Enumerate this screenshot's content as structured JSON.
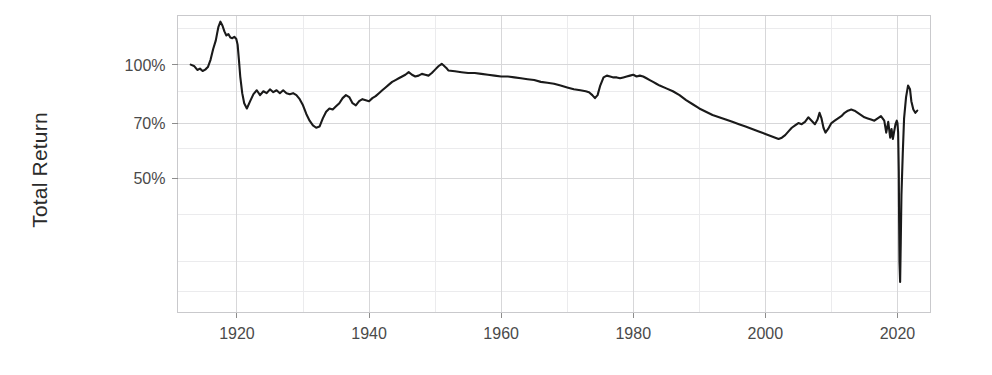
{
  "chart_data": {
    "type": "line",
    "title": "",
    "subtitle": "",
    "xlabel": "",
    "ylabel": "Total Return",
    "y_scale": "log",
    "x_scale": "linear",
    "grid": true,
    "legend": "none",
    "xlim": [
      1911,
      2025
    ],
    "ylim": [
      22,
      135
    ],
    "x_ticks": [
      1920,
      1940,
      1960,
      1980,
      2000,
      2020
    ],
    "x_tick_labels": [
      "1920",
      "1940",
      "1960",
      "1980",
      "2000",
      "2020"
    ],
    "y_ticks": [
      100,
      70,
      50
    ],
    "y_tick_labels": [
      "100%",
      "70%",
      "50%"
    ],
    "line_color": "#1a1a1a",
    "series": [
      {
        "name": "Total Return",
        "x": [
          1913.0,
          1913.5,
          1914.0,
          1914.4,
          1914.8,
          1915.2,
          1915.6,
          1916.0,
          1916.4,
          1916.8,
          1917.0,
          1917.2,
          1917.5,
          1917.8,
          1918.1,
          1918.4,
          1918.7,
          1919.0,
          1919.3,
          1919.6,
          1919.9,
          1920.1,
          1920.3,
          1920.5,
          1920.8,
          1921.1,
          1921.5,
          1922.0,
          1922.5,
          1923.0,
          1923.5,
          1924.0,
          1924.5,
          1925.0,
          1925.5,
          1926.0,
          1926.5,
          1927.0,
          1927.5,
          1928.0,
          1928.5,
          1929.0,
          1929.5,
          1930.0,
          1930.5,
          1931.0,
          1931.5,
          1932.0,
          1932.5,
          1933.0,
          1933.5,
          1934.0,
          1934.5,
          1935.0,
          1935.5,
          1936.0,
          1936.5,
          1937.0,
          1937.5,
          1938.0,
          1938.5,
          1939.0,
          1939.5,
          1940.0,
          1940.5,
          1941.0,
          1941.5,
          1942.0,
          1942.5,
          1943.0,
          1943.5,
          1944.0,
          1944.5,
          1945.0,
          1945.5,
          1946.0,
          1946.5,
          1947.0,
          1947.5,
          1948.0,
          1948.5,
          1949.0,
          1949.5,
          1950.0,
          1950.5,
          1951.0,
          1951.3,
          1951.7,
          1952.0,
          1953.0,
          1954.0,
          1955.0,
          1956.0,
          1957.0,
          1958.0,
          1959.0,
          1960.0,
          1961.0,
          1962.0,
          1963.0,
          1964.0,
          1965.0,
          1966.0,
          1967.0,
          1968.0,
          1969.0,
          1970.0,
          1971.0,
          1972.0,
          1972.8,
          1973.3,
          1973.8,
          1974.2,
          1974.6,
          1975.0,
          1975.5,
          1976.0,
          1976.5,
          1977.0,
          1977.5,
          1978.0,
          1978.5,
          1979.0,
          1979.5,
          1980.0,
          1980.5,
          1981.0,
          1981.5,
          1982.0,
          1982.5,
          1983.0,
          1983.5,
          1984.0,
          1985.0,
          1986.0,
          1987.0,
          1988.0,
          1989.0,
          1990.0,
          1991.0,
          1992.0,
          1993.0,
          1994.0,
          1995.0,
          1996.0,
          1997.0,
          1998.0,
          1999.0,
          2000.0,
          2000.5,
          2001.0,
          2001.5,
          2002.0,
          2002.5,
          2003.0,
          2003.5,
          2004.0,
          2004.5,
          2005.0,
          2005.5,
          2006.0,
          2006.5,
          2007.0,
          2007.5,
          2007.9,
          2008.2,
          2008.5,
          2008.8,
          2009.1,
          2009.5,
          2010.0,
          2010.5,
          2011.0,
          2011.5,
          2012.0,
          2012.5,
          2013.0,
          2013.5,
          2014.0,
          2014.5,
          2015.0,
          2015.5,
          2016.0,
          2016.5,
          2017.0,
          2017.5,
          2018.0,
          2018.3,
          2018.6,
          2018.9,
          2019.1,
          2019.3,
          2019.5,
          2019.7,
          2019.9,
          2020.0,
          2020.1,
          2020.2,
          2020.25,
          2020.3,
          2020.4,
          2020.5,
          2020.6,
          2020.8,
          2021.0,
          2021.3,
          2021.6,
          2021.9,
          2022.1,
          2022.4,
          2022.7,
          2023.0
        ],
        "values": [
          100.0,
          99.2,
          96.8,
          97.6,
          96.2,
          97.0,
          98.5,
          103.0,
          110.0,
          116.0,
          121.0,
          126.0,
          130.0,
          127.0,
          122.5,
          119.5,
          120.5,
          118.0,
          117.5,
          118.5,
          117.0,
          113.0,
          103.0,
          93.0,
          84.0,
          79.0,
          76.5,
          80.0,
          83.5,
          85.5,
          83.0,
          85.0,
          84.0,
          86.0,
          84.5,
          85.5,
          84.0,
          85.5,
          84.0,
          83.5,
          84.0,
          83.0,
          81.0,
          78.0,
          74.0,
          71.0,
          69.0,
          68.0,
          68.5,
          72.0,
          75.0,
          76.5,
          76.0,
          77.5,
          79.0,
          81.5,
          83.0,
          82.0,
          79.0,
          78.0,
          80.0,
          81.0,
          80.5,
          80.0,
          81.5,
          82.5,
          84.0,
          85.5,
          87.0,
          88.5,
          90.0,
          91.0,
          92.0,
          93.0,
          94.0,
          95.5,
          94.0,
          93.0,
          93.5,
          94.5,
          94.0,
          93.5,
          95.0,
          97.0,
          99.0,
          100.5,
          99.5,
          98.0,
          96.5,
          96.0,
          95.5,
          95.0,
          95.0,
          94.5,
          94.0,
          93.5,
          93.0,
          93.0,
          92.5,
          92.0,
          91.5,
          91.0,
          90.0,
          89.5,
          89.0,
          88.0,
          87.0,
          86.0,
          85.5,
          85.0,
          84.5,
          83.0,
          81.5,
          83.0,
          88.0,
          92.5,
          93.5,
          93.0,
          92.5,
          92.5,
          92.0,
          92.5,
          93.0,
          93.5,
          94.0,
          93.0,
          93.5,
          93.0,
          92.0,
          91.0,
          90.0,
          89.0,
          88.0,
          86.5,
          85.0,
          83.0,
          80.5,
          78.5,
          76.5,
          75.0,
          73.5,
          72.5,
          71.5,
          70.5,
          69.5,
          68.5,
          67.5,
          66.5,
          65.5,
          65.0,
          64.5,
          64.0,
          63.5,
          64.0,
          65.0,
          66.5,
          68.0,
          69.0,
          70.0,
          69.5,
          70.5,
          72.5,
          71.0,
          69.5,
          71.5,
          74.5,
          72.0,
          68.0,
          66.0,
          67.5,
          70.0,
          71.0,
          72.0,
          73.0,
          74.5,
          75.5,
          76.0,
          75.5,
          74.5,
          73.5,
          72.5,
          72.0,
          71.5,
          71.0,
          72.0,
          73.0,
          71.0,
          66.0,
          70.5,
          64.0,
          67.5,
          63.5,
          66.5,
          69.5,
          71.0,
          70.0,
          66.0,
          52.0,
          38.0,
          30.0,
          26.5,
          34.0,
          45.0,
          58.0,
          72.0,
          82.0,
          88.0,
          86.0,
          80.0,
          76.0,
          74.5,
          75.5
        ]
      }
    ]
  },
  "axes": {
    "y_title": "Total Return",
    "y_tick_labels": [
      "100%",
      "70%",
      "50%"
    ],
    "x_tick_labels": [
      "1920",
      "1940",
      "1960",
      "1980",
      "2000",
      "2020"
    ]
  },
  "style": {
    "line_color": "#1a1a1a",
    "grid_major_color": "#d7d7d9",
    "grid_minor_color": "#ebebed",
    "panel_border_color": "#c9c9cc",
    "background": "#ffffff",
    "tick_label_color": "#4a4a4a",
    "axis_title_color": "#2b2b2b"
  }
}
